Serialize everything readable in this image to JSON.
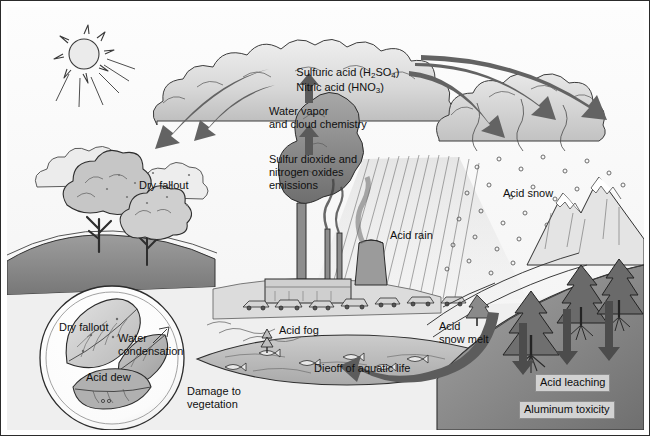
{
  "diagram": {
    "type": "illustration",
    "style": "pencil-sketch grayscale",
    "colors": {
      "ink": "#1a1a1a",
      "arrow_dark": "#4a4a4a",
      "cloud_fill": "#d8d8d8",
      "ground_dark": "#8a8a8a",
      "water": "#b9b9b9",
      "box_fill": "#d2d2d2"
    }
  },
  "labels": {
    "sulfuric_acid": "Sulfuric acid (H",
    "sulfuric_acid_sub1": "2",
    "sulfuric_acid_mid": "SO",
    "sulfuric_acid_sub2": "4",
    "sulfuric_acid_end": ")",
    "nitric_acid": "Nitric acid (HNO",
    "nitric_acid_sub": "3",
    "nitric_acid_end": ")",
    "water_vapor": "Water vapor\nand cloud chemistry",
    "emissions": "Sulfur dioxide and\nnitrogen oxides\nemissions",
    "dry_fallout_sky": "Dry fallout",
    "acid_rain": "Acid rain",
    "acid_snow": "Acid snow",
    "acid_fog": "Acid fog",
    "acid_snow_melt": "Acid\nsnow melt",
    "dieoff": "Dieoff of aquatic life",
    "damage_vegetation": "Damage to\nvegetation",
    "inset_dry_fallout": "Dry fallout",
    "inset_water_condensation": "Water\ncondensation",
    "inset_acid_dew": "Acid dew",
    "acid_leaching": "Acid leaching",
    "aluminum_toxicity": "Aluminum toxicity"
  },
  "icons": {
    "sun": "sun-icon",
    "cloud": "cloud-icon",
    "smokestack": "smokestack-icon",
    "cooling_tower": "cooling-tower-icon",
    "deciduous_tree": "deciduous-tree-icon",
    "conifer_tree": "conifer-tree-icon",
    "mountain": "mountain-icon",
    "fish": "dead-fish-icon",
    "leaf": "leaf-icon",
    "car": "car-icon"
  },
  "arrows": {
    "up_to_cloud_1": "upward-arrow",
    "up_to_cloud_2": "upward-arrow",
    "curved_left_1": "curved-arrow-left",
    "curved_left_2": "curved-arrow-left",
    "curved_right_1": "curved-arrow-right",
    "curved_right_2": "curved-arrow-right",
    "curved_right_3": "curved-arrow-right",
    "leaching_down_1": "down-arrow",
    "leaching_down_2": "down-arrow",
    "leaching_down_3": "down-arrow",
    "runoff_to_lake": "curved-arrow-runoff"
  }
}
